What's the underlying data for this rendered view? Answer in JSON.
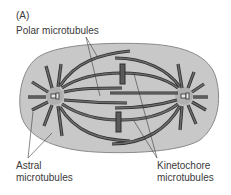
{
  "figure": {
    "panel_label": "(A)",
    "labels": {
      "polar": "Polar microtubules",
      "astral_line1": "Astral",
      "astral_line2": "microtubules",
      "kinetochore_line1": "Kinetochore",
      "kinetochore_line2": "microtubules"
    },
    "colors": {
      "cell_fill": "#c8c8c8",
      "cell_outline": "#8a8a8a",
      "microtubule": "#5a5a5a",
      "microtubule_edge": "#2e2e2e",
      "centrosome_glow": "#b0b0b0",
      "leader_line": "#3a3a3a",
      "text": "#3a3a3a"
    }
  }
}
